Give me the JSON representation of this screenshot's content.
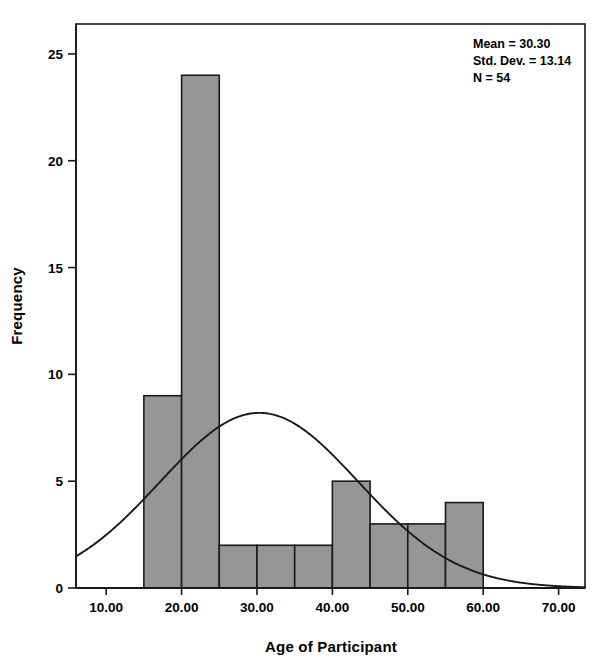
{
  "chart_data": {
    "type": "bar",
    "title": "",
    "xlabel": "Age of Participant",
    "ylabel": "Frequency",
    "xlim": [
      6.0,
      73.5
    ],
    "ylim": [
      0,
      26.4
    ],
    "grid": false,
    "bin_width": 5,
    "categories": [
      "15-20",
      "20-25",
      "25-30",
      "30-35",
      "35-40",
      "40-45",
      "45-50",
      "50-55",
      "55-60"
    ],
    "bin_edges": [
      15,
      20,
      25,
      30,
      35,
      40,
      45,
      50,
      55,
      60
    ],
    "values": [
      9,
      24,
      2,
      2,
      2,
      5,
      3,
      3,
      4
    ],
    "xticks": [
      10,
      20,
      30,
      40,
      50,
      60,
      70
    ],
    "xtick_labels": [
      "10.00",
      "20.00",
      "30.00",
      "40.00",
      "50.00",
      "60.00",
      "70.00"
    ],
    "yticks": [
      0,
      5,
      10,
      15,
      20,
      25
    ],
    "ytick_labels": [
      "0",
      "5",
      "10",
      "15",
      "20",
      "25"
    ],
    "overlay": {
      "type": "line",
      "name": "normal-curve",
      "mean": 30.3,
      "std_dev": 13.14,
      "n": 54,
      "bin_width": 5,
      "peak_value": 8.2,
      "peak_x": 30.3
    },
    "annotations": {
      "mean_label": "Mean = 30.30",
      "std_dev_label": "Std. Dev. = 13.14",
      "n_label": "N = 54"
    },
    "colors": {
      "bar_fill": "#969696",
      "bar_edge": "#1a1a1a",
      "curve": "#1a1a1a",
      "axis": "#1a1a1a",
      "background": "#ffffff",
      "text": "#000000"
    }
  }
}
